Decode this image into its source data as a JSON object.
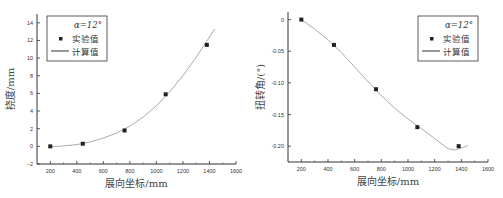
{
  "chart_data": [
    {
      "type": "scatter+line",
      "title": "",
      "xlabel": "展向坐标/mm",
      "ylabel": "挠度/mm",
      "xlim": [
        100,
        1600
      ],
      "ylim": [
        -2,
        15
      ],
      "xticks": [
        200,
        400,
        600,
        800,
        1000,
        1200,
        1400,
        1600
      ],
      "yticks": [
        -2,
        0,
        2,
        4,
        6,
        8,
        10,
        12,
        14
      ],
      "legend": {
        "title": "α=12°",
        "position": "upper-left",
        "entries": [
          "实验值",
          "计算值"
        ]
      },
      "series": [
        {
          "name": "实验值",
          "kind": "scatter",
          "x": [
            200,
            445,
            760,
            1070,
            1380
          ],
          "y": [
            0,
            0.3,
            1.8,
            5.9,
            11.5
          ]
        },
        {
          "name": "计算值",
          "kind": "line",
          "x": [
            200,
            300,
            400,
            500,
            600,
            700,
            800,
            900,
            1000,
            1100,
            1200,
            1300,
            1400,
            1440
          ],
          "y": [
            -0.05,
            0.05,
            0.2,
            0.5,
            0.95,
            1.5,
            2.3,
            3.3,
            4.6,
            6.2,
            8.0,
            10.1,
            12.4,
            13.3
          ]
        }
      ]
    },
    {
      "type": "scatter+line",
      "title": "",
      "xlabel": "展向坐标/mm",
      "ylabel": "扭转角/(°)",
      "xlim": [
        100,
        1600
      ],
      "ylim": [
        -0.225,
        0.012
      ],
      "xticks": [
        200,
        400,
        600,
        800,
        1000,
        1200,
        1400,
        1600
      ],
      "yticks": [
        0,
        -0.05,
        -0.1,
        -0.15,
        -0.2
      ],
      "ytick_labels": [
        "0",
        "-0.05",
        "-0.10",
        "-0.15",
        "-0.20"
      ],
      "legend": {
        "title": "α=12°",
        "position": "upper-right",
        "entries": [
          "实验值",
          "计算值"
        ]
      },
      "series": [
        {
          "name": "实验值",
          "kind": "scatter",
          "x": [
            200,
            445,
            760,
            1070,
            1380
          ],
          "y": [
            0,
            -0.04,
            -0.11,
            -0.17,
            -0.2
          ]
        },
        {
          "name": "计算值",
          "kind": "line",
          "x": [
            200,
            300,
            400,
            500,
            600,
            700,
            800,
            900,
            1000,
            1100,
            1200,
            1300,
            1350,
            1400,
            1450
          ],
          "y": [
            0,
            -0.015,
            -0.032,
            -0.052,
            -0.075,
            -0.098,
            -0.12,
            -0.14,
            -0.157,
            -0.172,
            -0.188,
            -0.204,
            -0.206,
            -0.203,
            -0.199
          ]
        }
      ]
    }
  ]
}
